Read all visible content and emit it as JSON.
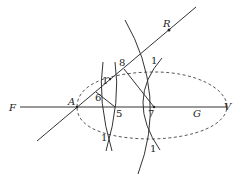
{
  "diagram": {
    "labels": {
      "F": "F",
      "A": "A",
      "R": "R",
      "G": "G",
      "V": "V",
      "p1_upper_left": "1",
      "p1_upper_right": "1",
      "p1_lower_left": "1",
      "p1_lower_right": "1",
      "p5": "5",
      "p6": "6",
      "p7": "7",
      "p8": "8"
    },
    "colors": {
      "stroke": "#333333",
      "text": "#222222",
      "background": "#ffffff"
    }
  }
}
